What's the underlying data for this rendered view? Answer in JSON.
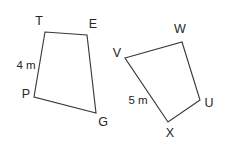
{
  "figure": {
    "background_color": "#ffffff",
    "stroke_color": "#3a3a3a",
    "text_color": "#252525",
    "shapes": [
      {
        "id": "quad-left",
        "name": "quadrilateral-TEGP",
        "vertex_order": "T, E, G, P",
        "points": "45,32 87,35 96,113 34,97",
        "vertices": [
          {
            "label": "T",
            "x": 45,
            "y": 32,
            "label_x": 39,
            "label_y": 22
          },
          {
            "label": "E",
            "x": 87,
            "y": 35,
            "label_x": 93,
            "label_y": 25
          },
          {
            "label": "G",
            "x": 96,
            "y": 113,
            "label_x": 103,
            "label_y": 123
          },
          {
            "label": "P",
            "x": 34,
            "y": 97,
            "label_x": 26,
            "label_y": 95
          }
        ],
        "measures": [
          {
            "text": "4 m",
            "side": "T-P",
            "x": 26,
            "y": 66
          }
        ]
      },
      {
        "id": "quad-right",
        "name": "quadrilateral-VWUX",
        "vertex_order": "V, W, U, X",
        "points": "125,58 182,42 200,100 168,122",
        "vertices": [
          {
            "label": "V",
            "x": 125,
            "y": 58,
            "label_x": 117,
            "label_y": 54
          },
          {
            "label": "W",
            "x": 182,
            "y": 42,
            "label_x": 180,
            "label_y": 30
          },
          {
            "label": "U",
            "x": 200,
            "y": 100,
            "label_x": 209,
            "label_y": 104
          },
          {
            "label": "X",
            "x": 168,
            "y": 122,
            "label_x": 170,
            "label_y": 134
          }
        ],
        "measures": [
          {
            "text": "5 m",
            "side": "V-X",
            "x": 138,
            "y": 101
          }
        ]
      }
    ]
  }
}
